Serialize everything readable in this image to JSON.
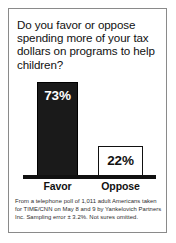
{
  "headline": "Do you favor or oppose spending more of your tax dollars on programs to help children?",
  "footnote": {
    "line1": "From a telephone poll of 1,011 adult Americans taken",
    "line2": "for TIME/CNN on May 8 and 9 by Yankelovich Partners",
    "line3": "Inc. Sampling error ± 3.2%. Not sures omitted."
  },
  "colors": {
    "bar_favor": "#1a1a1a",
    "bar_oppose": "#ffffff",
    "border": "#8a8a8a",
    "text": "#111111"
  },
  "chart_data": {
    "type": "bar",
    "title": "Do you favor or oppose spending more of your tax dollars on programs to help children?",
    "categories": [
      "Favor",
      "Oppose"
    ],
    "values": [
      73,
      22
    ],
    "value_labels": [
      "73%",
      "22%"
    ],
    "xlabel": "",
    "ylabel": "",
    "ylim": [
      0,
      80
    ],
    "grid": false,
    "legend": "none",
    "series": [
      {
        "name": "Percent of respondents",
        "values": [
          73,
          22
        ]
      }
    ],
    "annotations": [
      "From a telephone poll of 1,011 adult Americans taken for TIME/CNN on May 8 and 9 by Yankelovich Partners Inc. Sampling error ± 3.2%. Not sures omitted."
    ]
  }
}
